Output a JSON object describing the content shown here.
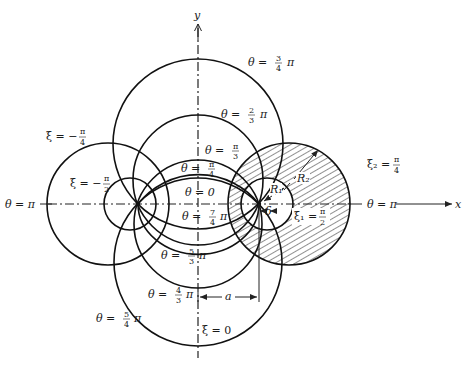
{
  "figure": {
    "type": "bipolar-coordinate-diagram",
    "axes": {
      "x_label": "x",
      "y_label": "y"
    },
    "foci": {
      "left": [
        138,
        204
      ],
      "right": [
        259,
        204
      ],
      "half_distance_label": "a"
    },
    "theta_labels": [
      {
        "id": "theta-3-4-pi",
        "pre": "θ =",
        "num": "3",
        "den": "4",
        "post": "π",
        "x": 262,
        "y": 63
      },
      {
        "id": "theta-2-3-pi",
        "pre": "θ =",
        "num": "2",
        "den": "3",
        "post": "π",
        "x": 221,
        "y": 117
      },
      {
        "id": "theta-pi-3",
        "pre": "θ =",
        "num": "π",
        "den": "3",
        "post": "",
        "x": 205,
        "y": 154
      },
      {
        "id": "theta-pi-4",
        "pre": "θ =",
        "num": "π",
        "den": "4",
        "post": "",
        "x": 181,
        "y": 170
      },
      {
        "id": "theta-0",
        "pre": "θ = 0",
        "num": "",
        "den": "",
        "post": "",
        "x": 185,
        "y": 196
      },
      {
        "id": "theta-7-4-pi",
        "pre": "θ =",
        "num": "7",
        "den": "4",
        "post": "π",
        "x": 182,
        "y": 220
      },
      {
        "id": "theta-5-3-pi",
        "pre": "θ =",
        "num": "5",
        "den": "3",
        "post": "π",
        "x": 161,
        "y": 259
      },
      {
        "id": "theta-4-3-pi",
        "pre": "θ =",
        "num": "4",
        "den": "3",
        "post": "π",
        "x": 148,
        "y": 297
      },
      {
        "id": "theta-5-4-pi",
        "pre": "θ =",
        "num": "5",
        "den": "4",
        "post": "π",
        "x": 98,
        "y": 321
      },
      {
        "id": "theta-pi-left",
        "pre": "θ = π",
        "num": "",
        "den": "",
        "post": "",
        "x": 16,
        "y": 207
      },
      {
        "id": "theta-pi-right",
        "pre": "θ = π",
        "num": "",
        "den": "",
        "post": "",
        "x": 366,
        "y": 207
      }
    ],
    "xi_labels": [
      {
        "id": "xi-neg-pi-4",
        "pre": "ξ = −",
        "num": "π",
        "den": "4",
        "x": 49,
        "y": 141
      },
      {
        "id": "xi-neg-pi-2",
        "pre": "ξ = −",
        "num": "π",
        "den": "2",
        "x": 72,
        "y": 188
      },
      {
        "id": "xi-0",
        "pre": "ξ = 0",
        "num": "",
        "den": "",
        "x": 202,
        "y": 334
      },
      {
        "id": "xi2-pi-4",
        "pre": "ξ₂ =",
        "num": "π",
        "den": "4",
        "x": 368,
        "y": 166
      },
      {
        "id": "xi1-pi-2",
        "pre": "ξ₁ =",
        "num": "π",
        "den": "2",
        "x": 295,
        "y": 218
      }
    ],
    "dimension_labels": {
      "R1": "R₁",
      "R2": "R₂",
      "delta": "δ",
      "a": "a"
    },
    "theta_circles": [
      {
        "name": "theta-3-4-pi-circle",
        "cx": 198,
        "cy": 144,
        "r": 85
      },
      {
        "name": "theta-2-3-pi-circle",
        "cx": 198,
        "cy": 180,
        "r": 65
      },
      {
        "name": "theta-pi-3-circle",
        "cx": 198,
        "cy": 224,
        "r": 64
      },
      {
        "name": "theta-5-4-pi-circle",
        "cx": 198,
        "cy": 262,
        "r": 84
      }
    ],
    "xi_circles": [
      {
        "name": "xi-neg-pi-4-circle",
        "cx": 108,
        "cy": 204,
        "r": 61
      },
      {
        "name": "xi-neg-pi-2-circle",
        "cx": 130,
        "cy": 204,
        "r": 26
      },
      {
        "name": "xi2-pi-4-circle",
        "cx": 289,
        "cy": 204,
        "r": 61,
        "hatched": true
      },
      {
        "name": "xi1-pi-2-circle",
        "cx": 267,
        "cy": 204,
        "r": 26
      }
    ],
    "colors": {
      "ink": "#111111",
      "background": "#ffffff"
    }
  }
}
